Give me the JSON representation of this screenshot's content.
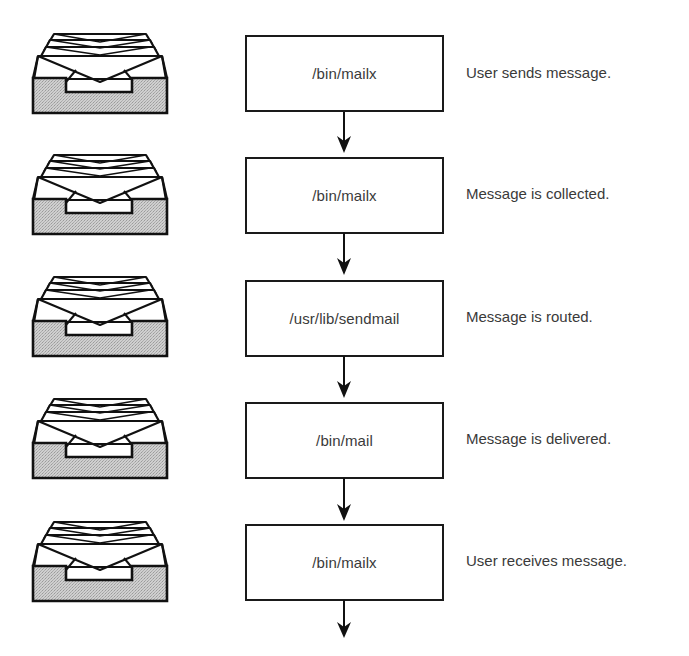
{
  "diagram": {
    "type": "flowchart",
    "direction": "top-to-bottom",
    "icon": "mail-tray-icon",
    "colors": {
      "line": "#1a1a1a",
      "text": "#3a3a3a",
      "tray_fill": "#c8c8c8",
      "background": "#ffffff"
    },
    "steps": [
      {
        "program": "/bin/mailx",
        "description": "User sends message."
      },
      {
        "program": "/bin/mailx",
        "description": "Message is collected."
      },
      {
        "program": "/usr/lib/sendmail",
        "description": "Message is routed."
      },
      {
        "program": "/bin/mail",
        "description": "Message is delivered."
      },
      {
        "program": "/bin/mailx",
        "description": "User receives message."
      }
    ],
    "arrows": [
      {
        "from": 0,
        "to": 1
      },
      {
        "from": 1,
        "to": 2
      },
      {
        "from": 2,
        "to": 3
      },
      {
        "from": 3,
        "to": 4
      },
      {
        "from": 4,
        "to": null
      }
    ]
  }
}
